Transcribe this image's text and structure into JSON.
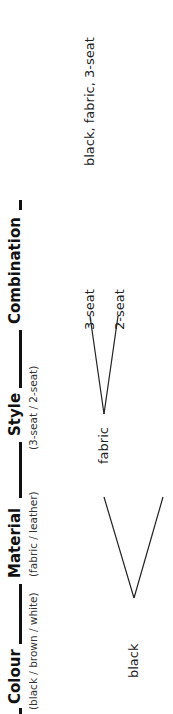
{
  "diagram": {
    "orientation": "rotated -90deg (reads bottom-to-top)",
    "headers": [
      {
        "title": "Colour",
        "options": "(black / brown / white)"
      },
      {
        "title": "Material",
        "options": "(fabric / leather)"
      },
      {
        "title": "Style",
        "options": "(3-seat / 2-seat)"
      },
      {
        "title": "Combination",
        "options": ""
      }
    ],
    "tree": {
      "colour": "black",
      "material": "fabric",
      "styles": [
        "3-seat",
        "2-seat"
      ],
      "combination": "black, fabric, 3-seat"
    },
    "colors": {
      "line": "#222222",
      "header_bar": "#111111",
      "background": "#ffffff"
    }
  }
}
